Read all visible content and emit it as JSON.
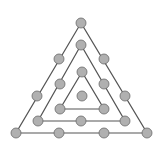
{
  "diagram": {
    "line_color": "#555555",
    "dot_fill": "#b0b0b0",
    "dot_stroke": "#6a6a6a",
    "triangles": [
      {
        "name": "outer",
        "points": [
          [
            81,
            23
          ],
          [
            16,
            133
          ],
          [
            147,
            133
          ]
        ]
      },
      {
        "name": "middle",
        "points": [
          [
            81,
            45
          ],
          [
            38,
            121
          ],
          [
            125,
            121
          ]
        ]
      },
      {
        "name": "inner",
        "points": [
          [
            82,
            72
          ],
          [
            60,
            109
          ],
          [
            104,
            109
          ]
        ]
      }
    ],
    "dots": [
      [
        81,
        23
      ],
      [
        59,
        59
      ],
      [
        104,
        59
      ],
      [
        37,
        96
      ],
      [
        125,
        96
      ],
      [
        16,
        133
      ],
      [
        59,
        133
      ],
      [
        104,
        133
      ],
      [
        147,
        133
      ],
      [
        81,
        45
      ],
      [
        60,
        84
      ],
      [
        104,
        84
      ],
      [
        38,
        121
      ],
      [
        81,
        121
      ],
      [
        125,
        121
      ],
      [
        82,
        72
      ],
      [
        60,
        109
      ],
      [
        104,
        109
      ],
      [
        82,
        96
      ]
    ]
  }
}
